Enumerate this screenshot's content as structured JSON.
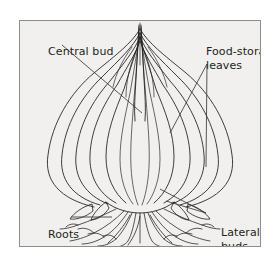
{
  "figure": {
    "kind": "botanical-diagram",
    "panel": {
      "background_color": "#f1f0ee",
      "border_color": "#8d8d8d",
      "page_background_color": "#ffffff"
    },
    "ink_color": "#1c1c1c",
    "text_color": "#231f20"
  },
  "labels": {
    "central_bud": "Central bud",
    "food_storage_line1": "Food-storage",
    "food_storage_line2": "leaves",
    "roots": "Roots",
    "lateral_line1": "Lateral",
    "lateral_line2": "buds"
  },
  "leaders": {
    "central_bud_count": 1,
    "food_storage_count": 2,
    "roots_count": 1,
    "lateral_buds_count": 2
  },
  "structure": {
    "leaf_layers": 7,
    "lateral_bud_count": 4,
    "root_count": 14
  }
}
